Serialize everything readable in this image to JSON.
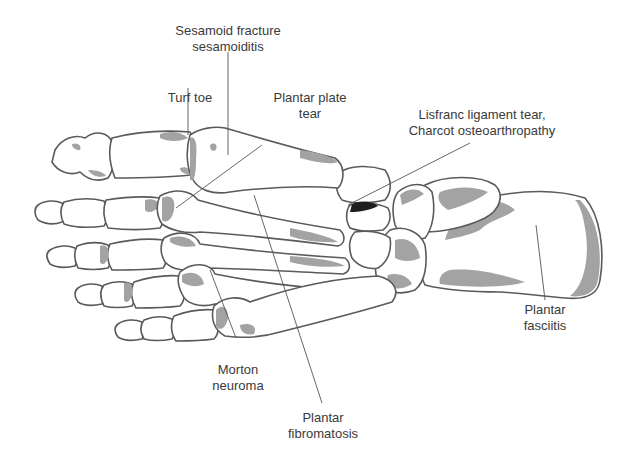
{
  "figure": {
    "colors": {
      "bone_fill": "#ffffff",
      "bone_outline": "#5a5a5a",
      "shading": "#a3a3a3",
      "label_text": "#3a3a3a",
      "leader_line": "#555555"
    }
  },
  "labels": {
    "sesamoid": {
      "line1": "Sesamoid fracture",
      "line2": "sesamoiditis"
    },
    "turf_toe": {
      "line1": "Turf toe"
    },
    "plantar_plate": {
      "line1": "Plantar plate",
      "line2": "tear"
    },
    "lisfranc": {
      "line1": "Lisfranc ligament tear,",
      "line2": "Charcot osteoarthropathy"
    },
    "plantar_fasciitis": {
      "line1": "Plantar",
      "line2": "fasciitis"
    },
    "morton": {
      "line1": "Morton",
      "line2": "neuroma"
    },
    "plantar_fibromatosis": {
      "line1": "Plantar",
      "line2": "fibromatosis"
    }
  }
}
